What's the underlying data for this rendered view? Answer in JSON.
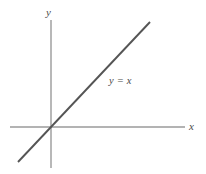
{
  "figure": {
    "background_color": "#ffffff",
    "width": 206,
    "height": 174,
    "axis_color": "#9a9a9a",
    "line_color": "#555555",
    "label_color": "#4a4a4a"
  },
  "labels": {
    "y_axis": "y",
    "x_axis": "x",
    "line_equation": "y = x"
  },
  "chart_data": {
    "type": "line",
    "title": "",
    "subtitle": "",
    "xlabel": "x",
    "ylabel": "y",
    "annotations": [
      {
        "text": "y = x",
        "x": 1.0,
        "y": 1.0,
        "description": "equation label placed beside the diagonal line in the first quadrant"
      }
    ],
    "legend": [],
    "legend_position": "none",
    "grid": false,
    "axis_style": "cartesian-cross-through-origin",
    "origin_px": [
      51,
      127
    ],
    "xlim": [
      -1.5,
      3.9
    ],
    "ylim": [
      -1.5,
      3.0
    ],
    "x_ticks": [],
    "y_ticks": [],
    "x_tick_labels": [],
    "y_tick_labels": [],
    "series": [
      {
        "name": "y = x",
        "equation": "y = x",
        "slope": 1,
        "intercept": 0,
        "color": "#555555",
        "x": [
          -1.1,
          2.4
        ],
        "values": [
          -1.1,
          2.4
        ],
        "endpoints_px": [
          [
            18,
            162
          ],
          [
            150,
            22
          ]
        ]
      }
    ],
    "axes_extent_px": {
      "x_axis": [
        [
          10,
          127
        ],
        [
          185,
          127
        ]
      ],
      "y_axis": [
        [
          51,
          20
        ],
        [
          51,
          168
        ]
      ]
    }
  }
}
